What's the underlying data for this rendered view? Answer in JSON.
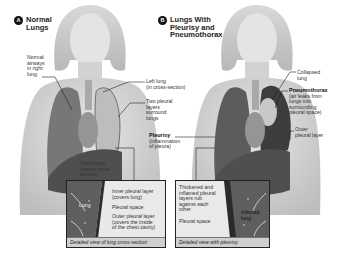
{
  "panels": [
    {
      "badge": "A",
      "title_line1": "Normal",
      "title_line2": "Lungs",
      "labels": {
        "normal_airways": [
          "Normal",
          "airways",
          "in right",
          "lung"
        ],
        "left_lung": [
          "Left lung",
          "(in cross-section)"
        ],
        "two_pleural": [
          "Two pleural",
          "layers",
          "surround",
          "lungs"
        ],
        "diaphragm": [
          "Diaphragm",
          "(partial cross-",
          "section)"
        ]
      },
      "inset": {
        "lung_label": "Lung",
        "inner_layer": [
          "Inner pleural layer",
          "(covers lung)"
        ],
        "pleural_space": "Pleural space",
        "outer_layer": [
          "Outer pleural layer",
          "(covers the inside",
          "of the chest cavity)"
        ],
        "caption": "Detailed view of lung cross-section"
      }
    },
    {
      "badge": "B",
      "title_line1": "Lungs With",
      "title_line2": "Pleurisy  and",
      "title_line3": "Pneumothorax",
      "labels": {
        "collapsed_lung": [
          "Collapsed",
          "lung"
        ],
        "pneumothorax_title": "Pneumothorax",
        "pneumothorax_desc": [
          "(air leaks from",
          "lungs into",
          "surrounding",
          "pleural space)"
        ],
        "outer_pleural": [
          "Outer",
          "pleural layer"
        ],
        "pleurisy_title": "Pleurisy",
        "pleurisy_desc": [
          "(inflammation",
          "of pleura)"
        ]
      },
      "inset": {
        "thickened": [
          "Thickened and",
          "inflamed pleural",
          "layers rub",
          "against each",
          "other"
        ],
        "pleural_space": "Pleural space",
        "infected_lung": [
          "Infected",
          "lung"
        ],
        "caption": "Detailed view with pleurisy"
      }
    }
  ],
  "colors": {
    "skin": "#d9d9d9",
    "lung_dark": "#5a5a5a",
    "lung_mid": "#8a8a8a",
    "inset_bg": "#e9e9e9",
    "pleura_dark": "#3a3a3a"
  }
}
